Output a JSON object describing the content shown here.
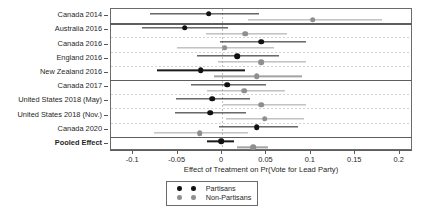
{
  "chart_data": {
    "type": "scatter",
    "subtype": "forest-plot",
    "title": "",
    "xlabel": "Effect of Treatment on Pr(Vote for Lead Party)",
    "ylabel": "",
    "xlim": [
      -0.125,
      0.215
    ],
    "xticks": [
      -0.1,
      -0.05,
      0,
      0.05,
      0.1,
      0.15,
      0.2
    ],
    "xticklabels": [
      "-0.1",
      "-0.05",
      "0",
      "0.05",
      "0.1",
      "0.15",
      "0.2"
    ],
    "grid": "horizontal-dashed",
    "reference_line": 0,
    "legend_position": "bottom-center",
    "legend": [
      "Partisans",
      "Non-Partisans"
    ],
    "colors": {
      "partisans": "#111111",
      "non_partisans": "#8f8f8f"
    },
    "categories": [
      "Canada 2014",
      "Australia 2016",
      "Canada 2016",
      "England 2016",
      "New Zealand 2016",
      "Canada 2017",
      "United States 2018 (May)",
      "United States 2018 (Nov.)",
      "Canada 2020",
      "Pooled Effect"
    ],
    "section_breaks_after": [
      "Canada 2014",
      "New Zealand 2016",
      "Canada 2020"
    ],
    "series": [
      {
        "name": "Partisans",
        "color": "#111111",
        "points": [
          {
            "category": "Canada 2014",
            "estimate": -0.015,
            "low": -0.081,
            "high": 0.042
          },
          {
            "category": "Australia 2016",
            "estimate": -0.042,
            "low": -0.09,
            "high": 0.007
          },
          {
            "category": "Canada 2016",
            "estimate": 0.044,
            "low": -0.002,
            "high": 0.095
          },
          {
            "category": "England 2016",
            "estimate": 0.017,
            "low": -0.028,
            "high": 0.064
          },
          {
            "category": "New Zealand 2016",
            "estimate": -0.024,
            "low": -0.073,
            "high": 0.026
          },
          {
            "category": "Canada 2017",
            "estimate": 0.006,
            "low": -0.035,
            "high": 0.049
          },
          {
            "category": "United States 2018 (May)",
            "estimate": -0.011,
            "low": -0.052,
            "high": 0.032
          },
          {
            "category": "United States 2018 (Nov.)",
            "estimate": -0.013,
            "low": -0.053,
            "high": 0.027
          },
          {
            "category": "Canada 2020",
            "estimate": 0.039,
            "low": -0.003,
            "high": 0.085
          },
          {
            "category": "Pooled Effect",
            "estimate": -0.001,
            "low": -0.017,
            "high": 0.013
          }
        ]
      },
      {
        "name": "Non-Partisans",
        "color": "#8f8f8f",
        "points": [
          {
            "category": "Canada 2014",
            "estimate": 0.102,
            "low": 0.029,
            "high": 0.18
          },
          {
            "category": "Australia 2016",
            "estimate": 0.026,
            "low": -0.018,
            "high": 0.073
          },
          {
            "category": "Canada 2016",
            "estimate": 0.003,
            "low": -0.051,
            "high": 0.059
          },
          {
            "category": "England 2016",
            "estimate": 0.044,
            "low": -0.004,
            "high": 0.094
          },
          {
            "category": "New Zealand 2016",
            "estimate": 0.039,
            "low": -0.009,
            "high": 0.09
          },
          {
            "category": "Canada 2017",
            "estimate": 0.025,
            "low": -0.017,
            "high": 0.071
          },
          {
            "category": "United States 2018 (May)",
            "estimate": 0.044,
            "low": 0.001,
            "high": 0.095
          },
          {
            "category": "United States 2018 (Nov.)",
            "estimate": 0.048,
            "low": 0.004,
            "high": 0.092
          },
          {
            "category": "Canada 2020",
            "estimate": -0.025,
            "low": -0.077,
            "high": 0.029
          },
          {
            "category": "Pooled Effect",
            "estimate": 0.035,
            "low": 0.017,
            "high": 0.052
          }
        ]
      }
    ]
  }
}
